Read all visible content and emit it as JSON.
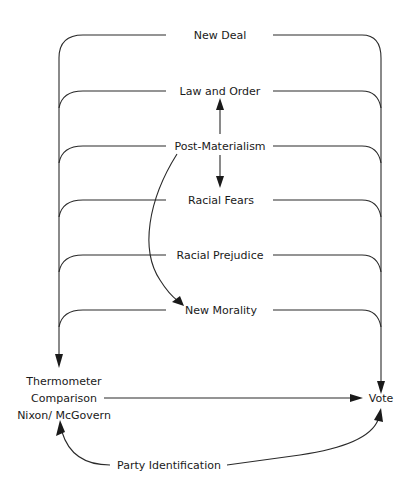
{
  "diagram": {
    "type": "path-diagram",
    "nodes": {
      "new_deal": "New Deal",
      "law_and_order": "Law and Order",
      "post_materialism": "Post-Materialism",
      "racial_fears": "Racial Fears",
      "racial_prejudice": "Racial Prejudice",
      "new_morality": "New Morality",
      "thermometer_line1": "Thermometer",
      "thermometer_line2": "Comparison",
      "thermometer_line3": "Nixon/ McGovern",
      "vote": "Vote",
      "party_identification": "Party Identification"
    },
    "edges": [
      {
        "from": "Post-Materialism",
        "to": "Law and Order"
      },
      {
        "from": "Post-Materialism",
        "to": "Racial Fears"
      },
      {
        "from": "Post-Materialism",
        "to": "New Morality"
      },
      {
        "from": "New Deal",
        "to": "Thermometer Comparison Nixon/ McGovern"
      },
      {
        "from": "New Deal",
        "to": "Vote"
      },
      {
        "from": "Law and Order",
        "to": "Thermometer Comparison Nixon/ McGovern"
      },
      {
        "from": "Law and Order",
        "to": "Vote"
      },
      {
        "from": "Post-Materialism",
        "to": "Thermometer Comparison Nixon/ McGovern"
      },
      {
        "from": "Post-Materialism",
        "to": "Vote"
      },
      {
        "from": "Racial Fears",
        "to": "Thermometer Comparison Nixon/ McGovern"
      },
      {
        "from": "Racial Fears",
        "to": "Vote"
      },
      {
        "from": "Racial Prejudice",
        "to": "Thermometer Comparison Nixon/ McGovern"
      },
      {
        "from": "Racial Prejudice",
        "to": "Vote"
      },
      {
        "from": "New Morality",
        "to": "Thermometer Comparison Nixon/ McGovern"
      },
      {
        "from": "New Morality",
        "to": "Vote"
      },
      {
        "from": "Thermometer Comparison Nixon/ McGovern",
        "to": "Vote"
      },
      {
        "from": "Party Identification",
        "to": "Thermometer Comparison Nixon/ McGovern"
      },
      {
        "from": "Party Identification",
        "to": "Vote"
      }
    ]
  }
}
